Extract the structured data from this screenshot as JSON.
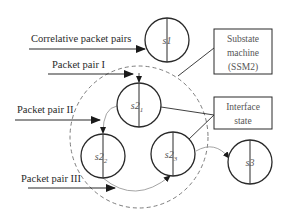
{
  "diagram": {
    "inputs": [
      {
        "id": "correlative",
        "label": "Correlative packet pairs",
        "y": 49,
        "x1": 29,
        "x2": 145,
        "label_x": 31,
        "label_y": 42
      },
      {
        "id": "pair1",
        "label": "Packet pair I",
        "y": 74,
        "x1": 48,
        "x2": 133,
        "label_x": 52,
        "label_y": 68
      },
      {
        "id": "pair2",
        "label": "Packet pair II",
        "y": 120,
        "x1": 15,
        "x2": 100,
        "label_x": 17,
        "label_y": 113
      },
      {
        "id": "pair3",
        "label": "Packet pair III",
        "y": 188,
        "x1": 28,
        "x2": 115,
        "label_x": 21,
        "label_y": 182
      }
    ],
    "states": [
      {
        "id": "s1",
        "label": "s1",
        "sub": "",
        "cx": 167,
        "cy": 40,
        "r": 22
      },
      {
        "id": "s2_1",
        "label": "s2",
        "sub": "1",
        "cx": 139,
        "cy": 105,
        "r": 22
      },
      {
        "id": "s2_2",
        "label": "s2",
        "sub": "2",
        "cx": 103,
        "cy": 156,
        "r": 22
      },
      {
        "id": "s2_3",
        "label": "s2",
        "sub": "3",
        "cx": 173,
        "cy": 154,
        "r": 22
      },
      {
        "id": "s3",
        "label": "s3",
        "sub": "",
        "cx": 250,
        "cy": 162,
        "r": 22
      }
    ],
    "substate_region": {
      "cx": 139,
      "cy": 137,
      "rx": 69,
      "ry": 71
    },
    "boxes": [
      {
        "id": "ssm2",
        "lines": [
          "Substate",
          "machine",
          "(SSM2)"
        ],
        "x": 214,
        "y": 29,
        "w": 58,
        "h": 45
      },
      {
        "id": "interface",
        "lines": [
          "Interface",
          "state"
        ],
        "x": 214,
        "y": 97,
        "w": 58,
        "h": 32
      }
    ],
    "colors": {
      "stroke": "#2a2a2a",
      "transition": "#9a9a9a",
      "dashed": "#6e6e6e"
    }
  }
}
